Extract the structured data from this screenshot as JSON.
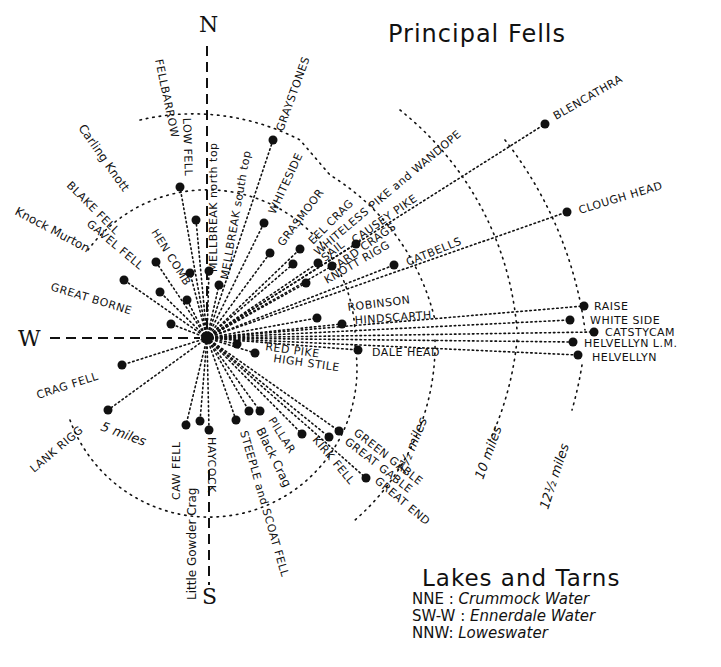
{
  "title": "Principal Fells",
  "cardinals": {
    "north": "N",
    "south": "S",
    "west": "W"
  },
  "rings": [
    {
      "label": "5 miles",
      "radius_px": 148
    },
    {
      "label": "7½ miles",
      "radius_px": 232
    },
    {
      "label": "10 miles",
      "radius_px": 312
    },
    {
      "label": "12½ miles",
      "radius_px": 392
    }
  ],
  "center": {
    "x": 207,
    "y": 338
  },
  "fells": [
    {
      "name": "FELLBARROW",
      "dot": [
        180,
        187
      ]
    },
    {
      "name": "LOW FELL",
      "dot": [
        196,
        220
      ]
    },
    {
      "name": "MELLBREAK north top",
      "dot": [
        209,
        271
      ]
    },
    {
      "name": "MELLBREAK south top",
      "dot": [
        219,
        285
      ]
    },
    {
      "name": "GRAYSTONES",
      "dot": [
        273,
        140
      ]
    },
    {
      "name": "WHITESIDE",
      "dot": [
        264,
        223
      ]
    },
    {
      "name": "GRASMOOR",
      "dot": [
        270,
        253
      ]
    },
    {
      "name": "EEL CRAG",
      "dot": [
        300,
        249
      ]
    },
    {
      "name": "WHITELESS PIKE and WANDOPE",
      "dot": [
        293,
        264
      ]
    },
    {
      "name": "SAIL",
      "dot": [
        318,
        263
      ]
    },
    {
      "name": "ARD CRAGS",
      "dot": [
        332,
        266
      ]
    },
    {
      "name": "CAUSEY PIKE",
      "dot": [
        356,
        244
      ]
    },
    {
      "name": "KNOTT RIGG",
      "dot": [
        306,
        283
      ]
    },
    {
      "name": "CATBELLS",
      "dot": [
        394,
        265
      ]
    },
    {
      "name": "BLENCATHRA",
      "dot": [
        545,
        124
      ]
    },
    {
      "name": "CLOUGH HEAD",
      "dot": [
        567,
        212
      ]
    },
    {
      "name": "ROBINSON",
      "dot": [
        317,
        318
      ]
    },
    {
      "name": "HINDSCARTH",
      "dot": [
        342,
        324
      ]
    },
    {
      "name": "DALE HEAD",
      "dot": [
        358,
        350
      ]
    },
    {
      "name": "RAISE",
      "dot": [
        584,
        306
      ]
    },
    {
      "name": "WHITE SIDE",
      "dot": [
        570,
        320
      ]
    },
    {
      "name": "CATSTYCAM",
      "dot": [
        594,
        332
      ]
    },
    {
      "name": "HELVELLYN L.M.",
      "dot": [
        573,
        342
      ]
    },
    {
      "name": "HELVELLYN",
      "dot": [
        578,
        355
      ]
    },
    {
      "name": "RED PIKE",
      "dot": [
        237,
        344
      ]
    },
    {
      "name": "HIGH STILE",
      "dot": [
        255,
        353
      ]
    },
    {
      "name": "CARLING KNOTT",
      "dot": [
        190,
        273
      ]
    },
    {
      "name": "HEN COMB",
      "dot": [
        187,
        300
      ]
    },
    {
      "name": "BLAKE FELL",
      "dot": [
        156,
        262
      ]
    },
    {
      "name": "GAVEL FELL",
      "dot": [
        160,
        292
      ]
    },
    {
      "name": "KNOCK MURTON",
      "dot": [
        124,
        280
      ]
    },
    {
      "name": "GREAT BORNE",
      "dot": [
        171,
        324
      ]
    },
    {
      "name": "CRAG FELL",
      "dot": [
        122,
        365
      ]
    },
    {
      "name": "LANK RIGG",
      "dot": [
        108,
        410
      ]
    },
    {
      "name": "CAW FELL",
      "dot": [
        186,
        425
      ]
    },
    {
      "name": "Little Gowder Crag",
      "dot": [
        200,
        421
      ]
    },
    {
      "name": "HAYCOCK",
      "dot": [
        209,
        430
      ]
    },
    {
      "name": "STEEPLE and SCOAT FELL",
      "dot": [
        236,
        420
      ]
    },
    {
      "name": "Black Crag",
      "dot": [
        249,
        411
      ]
    },
    {
      "name": "PILLAR",
      "dot": [
        260,
        411
      ]
    },
    {
      "name": "KIRK FELL",
      "dot": [
        302,
        434
      ]
    },
    {
      "name": "GREAT GABLE",
      "dot": [
        329,
        437
      ]
    },
    {
      "name": "GREEN GABLE",
      "dot": [
        339,
        431
      ]
    },
    {
      "name": "GREAT END",
      "dot": [
        366,
        478
      ]
    }
  ],
  "labels": {
    "fellbarrow": "FELLBARROW",
    "low_fell": "LOW FELL",
    "mellbreak_n": "MELLBREAK north top",
    "mellbreak_s": "MELLBREAK south top",
    "graystones": "GRAYSTONES",
    "whiteside": "WHITESIDE",
    "grasmoor": "GRASMOOR",
    "eel_crag": "EEL CRAG",
    "whiteless": "WHITELESS PIKE and WANDOPE",
    "sail": "SAIL",
    "causey": "CAUSEY PIKE",
    "ard": "ARD CRAGS",
    "knott_rigg": "KNOTT RIGG",
    "catbells": "CATBELLS",
    "blencathra": "BLENCATHRA",
    "clough": "CLOUGH HEAD",
    "robinson": "ROBINSON",
    "hindscarth": "HINDSCARTH",
    "dale_head": "DALE HEAD",
    "raise": "RAISE",
    "white_side": "WHITE SIDE",
    "catstycam": "CATSTYCAM",
    "helvellyn_lm": "HELVELLYN L.M.",
    "helvellyn": "HELVELLYN",
    "red_pike": "RED PIKE",
    "high_stile": "HIGH STILE",
    "carling": "Carling Knott",
    "hen_comb": "HEN COMB",
    "blake": "BLAKE FELL",
    "gavel": "GAVEL FELL",
    "knock": "Knock Murton",
    "great_borne": "GREAT BORNE",
    "crag_fell": "CRAG FELL",
    "lank_rigg": "LANK RIGG",
    "caw_fell": "CAW FELL",
    "little_gowder": "Little Gowder Crag",
    "haycock": "HAYCOCK",
    "steeple": "STEEPLE and SCOAT FELL",
    "black_crag": "Black Crag",
    "pillar": "PILLAR",
    "kirk_fell": "KIRK FELL",
    "green_gable": "GREEN GABLE",
    "great_gable": "GREAT GABLE",
    "great_end": "GREAT END"
  },
  "legend": {
    "title": "Lakes and Tarns",
    "items": [
      {
        "direction": "NNE",
        "lake": "Crummock Water"
      },
      {
        "direction": "SW-W",
        "lake": "Ennerdale Water"
      },
      {
        "direction": "NNW",
        "lake": "Loweswater"
      }
    ]
  },
  "colors": {
    "ink": "#111111",
    "paper": "#ffffff"
  }
}
